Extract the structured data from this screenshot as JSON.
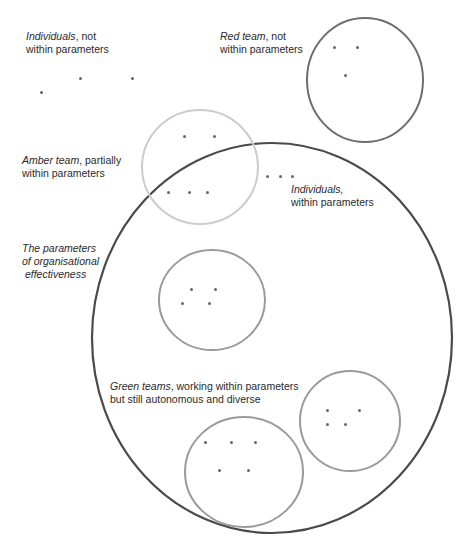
{
  "labels": {
    "individuals_out": {
      "italic": "Individuals",
      "rest": ", not",
      "line2": "within parameters"
    },
    "red_team": {
      "italic": "Red team",
      "rest": ", not",
      "line2": "within parameters"
    },
    "amber_team": {
      "italic": "Amber team",
      "rest": ", partially",
      "line2": "within parameters"
    },
    "individuals_in": {
      "italic": "Individuals,",
      "rest": "",
      "line2": "within parameters"
    },
    "parameters": {
      "line1": "The parameters",
      "line2": "of organisational",
      "line3": " effectiveness"
    },
    "green_teams": {
      "italic": "Green teams",
      "rest": ", working within parameters",
      "line2": "but still autonomous and diverse"
    }
  },
  "colors": {
    "parameters_circle": "#4a4a4a",
    "red_team_circle": "#6e6e6e",
    "amber_team_circle": "#c8c8c8",
    "green_team_circle": "#9a9a9a",
    "dot": "#666666"
  }
}
